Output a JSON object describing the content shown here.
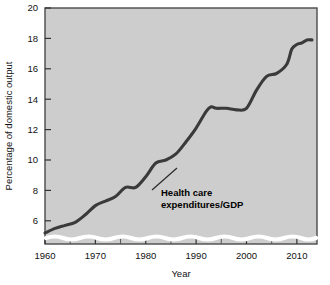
{
  "chart_data": {
    "type": "line",
    "title": "",
    "xlabel": "Year",
    "ylabel": "Percentage of domestic output",
    "xlim": [
      1960,
      2014
    ],
    "ylim": [
      5,
      20
    ],
    "y_axis_break": true,
    "y_break_note": "axis broken below 5 (wavy white band above x-axis)",
    "grid": false,
    "legend": "none",
    "xticks": [
      1960,
      1970,
      1980,
      1990,
      2000,
      2010
    ],
    "xticklabels": [
      "1960",
      "1970",
      "1980",
      "1990",
      "2000",
      "2010"
    ],
    "xminorticks": [
      1965,
      1975,
      1985,
      1995,
      2005
    ],
    "yticks": [
      6,
      8,
      10,
      12,
      14,
      16,
      18,
      20
    ],
    "yticklabels": [
      "6",
      "8",
      "10",
      "12",
      "14",
      "16",
      "18",
      "20"
    ],
    "annotations": [
      {
        "text_line1": "Health care",
        "text_line2": "expenditures/GDP",
        "points_to_year": 1983,
        "points_to_value": 9.3
      }
    ],
    "series": [
      {
        "name": "Health care expenditures/GDP",
        "color": "#3a3a3a",
        "x": [
          1960,
          1962,
          1964,
          1966,
          1968,
          1970,
          1972,
          1974,
          1976,
          1978,
          1980,
          1982,
          1984,
          1986,
          1988,
          1990,
          1992,
          1993,
          1994,
          1996,
          1998,
          2000,
          2002,
          2004,
          2006,
          2008,
          2009,
          2010,
          2011,
          2012,
          2013
        ],
        "values": [
          5.2,
          5.5,
          5.7,
          5.9,
          6.4,
          7.0,
          7.3,
          7.6,
          8.2,
          8.2,
          8.9,
          9.8,
          10.0,
          10.4,
          11.2,
          12.1,
          13.2,
          13.5,
          13.4,
          13.4,
          13.3,
          13.4,
          14.6,
          15.5,
          15.7,
          16.3,
          17.3,
          17.6,
          17.7,
          17.9,
          17.9
        ]
      }
    ]
  }
}
